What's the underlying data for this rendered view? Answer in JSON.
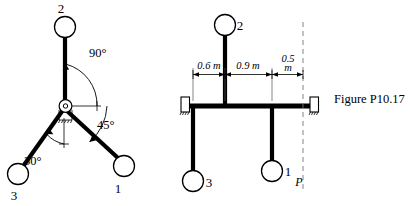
{
  "figure": {
    "caption": "Figure P10.17",
    "left_diagram": {
      "name": "three-bar-spider-pivot-view",
      "pivot_label": "pivot-joint",
      "bars": [
        {
          "id": "bar-2",
          "ball_label": "2",
          "label_position": "above"
        },
        {
          "id": "bar-1",
          "ball_label": "1",
          "label_position": "below-right"
        },
        {
          "id": "bar-3",
          "ball_label": "3",
          "label_position": "below"
        }
      ],
      "angles": [
        {
          "id": "angle-90",
          "text": "90°"
        },
        {
          "id": "angle-45",
          "text": "45°"
        },
        {
          "id": "angle-30",
          "text": "30°"
        }
      ]
    },
    "right_diagram": {
      "name": "beam-elevation-view",
      "bars": [
        {
          "id": "bar-2",
          "ball_label": "2",
          "direction": "up"
        },
        {
          "id": "bar-3",
          "ball_label": "3",
          "direction": "down"
        },
        {
          "id": "bar-1",
          "ball_label": "1",
          "direction": "down"
        }
      ],
      "dimensions": [
        {
          "id": "dim-0-6",
          "text": "0.6 m",
          "value": 0.6,
          "unit": "m"
        },
        {
          "id": "dim-0-9",
          "text": "0.9 m",
          "value": 0.9,
          "unit": "m"
        },
        {
          "id": "dim-0-5",
          "text_line1": "0.5",
          "text_line2": "m",
          "value": 0.5,
          "unit": "m"
        }
      ],
      "reference_line_label": "P",
      "supports": [
        {
          "id": "support-left",
          "type": "fixed"
        },
        {
          "id": "support-right",
          "type": "fixed"
        }
      ]
    }
  },
  "colors": {
    "ink": "#000000",
    "paper": "#ffffff",
    "thin_line": "#555555",
    "dash_line": "#777777"
  }
}
